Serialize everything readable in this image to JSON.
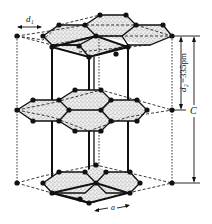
{
  "labels": {
    "bond_length": "d",
    "bond_length_sub": "1",
    "interlayer": "d",
    "interlayer_sub": "2",
    "interlayer_value": "=335pm",
    "lattice_c": "C",
    "lattice_a": "a"
  },
  "layers": [
    "top",
    "middle",
    "bottom"
  ],
  "colors": {
    "ink": "#111111",
    "shading": "#bdbdbd",
    "background": "#ffffff"
  }
}
